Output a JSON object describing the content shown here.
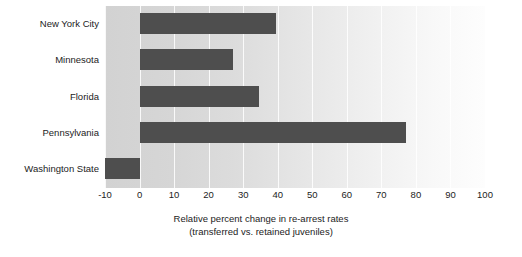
{
  "chart_data": {
    "type": "bar",
    "orientation": "horizontal",
    "title": "",
    "xlabel_line1": "Relative percent change in re-arrest rates",
    "xlabel_line2": "(transferred vs. retained juveniles)",
    "ylabel": "",
    "categories": [
      "New York City",
      "Minnesota",
      "Florida",
      "Pennsylvania",
      "Washington State"
    ],
    "values": [
      39.5,
      27,
      34.5,
      77,
      -10
    ],
    "xlim": [
      -10,
      100
    ],
    "xticks": [
      -10,
      0,
      10,
      20,
      30,
      40,
      50,
      60,
      70,
      80,
      90,
      100
    ],
    "xtick_labels": [
      "-10",
      "0",
      "10",
      "20",
      "30",
      "40",
      "50",
      "60",
      "70",
      "80",
      "90",
      "100"
    ],
    "grid": true,
    "grid_axis": "x",
    "legend": null,
    "bar_color": "#4e4e4e",
    "plot_background_left": "#d2d2d2",
    "plot_background_right": "#fdfdfd",
    "text_color": "#1c1c1c"
  }
}
